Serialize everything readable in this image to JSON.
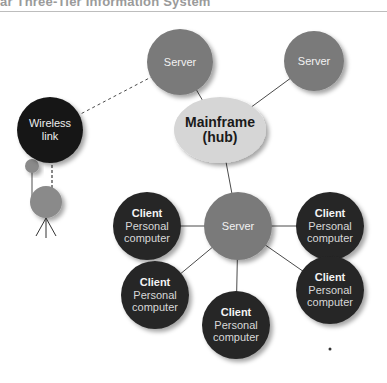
{
  "header": {
    "title": "ar Three-Tier Information System"
  },
  "colors": {
    "server": "#7a7a7a",
    "client": "#262626",
    "wireless": "#161616",
    "hub": "#d6d6d6",
    "line": "#4a4a4a",
    "antenna": "#8a8a8a"
  },
  "nodes": {
    "server_top_left": {
      "label": "Server"
    },
    "server_top_right": {
      "label": "Server"
    },
    "wireless": {
      "line1": "Wireless",
      "line2": "link"
    },
    "hub": {
      "line1": "Mainframe",
      "line2": "(hub)"
    },
    "server_center": {
      "label": "Server"
    },
    "clients": [
      {
        "title": "Client",
        "line1": "Personal",
        "line2": "computer"
      },
      {
        "title": "Client",
        "line1": "Personal",
        "line2": "computer"
      },
      {
        "title": "Client",
        "line1": "Personal",
        "line2": "computer"
      },
      {
        "title": "Client",
        "line1": "Personal",
        "line2": "computer"
      },
      {
        "title": "Client",
        "line1": "Personal",
        "line2": "computer"
      }
    ]
  }
}
